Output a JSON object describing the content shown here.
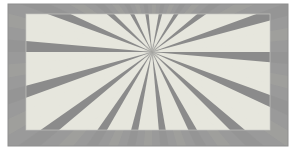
{
  "image": {
    "title": "Radial sunburst pattern",
    "width": 293,
    "height": 150,
    "background_color": "#ffffff"
  },
  "palette": {
    "page_background": "#ffffff",
    "frame_fill": "#9a9a9a",
    "frame_ray_light": "#a4a49e",
    "frame_ray_dark": "#919191",
    "frame_edge_line": "#8e8e8e",
    "panel_ray_light": "#e6e6dd",
    "panel_ray_dark": "#8b8b8b",
    "panel_edge_highlight": "#c9c9c4",
    "center_smudge": "#8a8a8a"
  },
  "frame": {
    "name": "outer-frame",
    "x": 8,
    "y": 4,
    "width": 280,
    "height": 142,
    "fill": "#9a9a9a"
  },
  "panel": {
    "name": "inner-panel",
    "x": 26,
    "y": 14,
    "width": 244,
    "height": 116,
    "clip_id": "panel-clip"
  },
  "sunburst": {
    "center_x": 152,
    "center_y": 52,
    "ray_length": 520,
    "ray_count": 36,
    "angle_step_deg": 10,
    "angle_offset_deg": -90,
    "duty_cycle": 0.5,
    "light_ray_fill": "#e6e6dd",
    "dark_ray_fill": "#8b8b8b",
    "frame_light_ray_fill": "#a4a49e",
    "frame_dark_ray_fill": "#919191",
    "description": "Alternating light and dark wedges radiating from a single convergence point near the upper middle of the panel."
  },
  "labels": {
    "figure_caption": "",
    "center_label": ""
  }
}
